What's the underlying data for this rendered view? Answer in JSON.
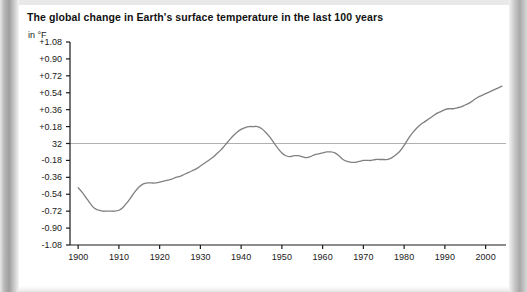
{
  "figure": {
    "title": "The global change in Earth's surface temperature in the last 100 years",
    "unit_label": "in °F"
  },
  "colors": {
    "line": "#808080",
    "zero_line": "#b0b0b0",
    "axis": "#1a1a1a",
    "text": "#1a1a1a",
    "page": "#ffffff"
  },
  "chart_data": {
    "type": "line",
    "title": "The global change in Earth's surface temperature in the last 100 years",
    "subtitle": "in °F",
    "xlabel": "",
    "ylabel": "in °F",
    "xlim": [
      1898,
      2005
    ],
    "ylim": [
      -1.08,
      1.08
    ],
    "grid": false,
    "legend": null,
    "zero_reference": {
      "value": 0,
      "label": "32"
    },
    "ytick_labels": [
      "+1.08",
      "+0.90",
      "+0.72",
      "+0.54",
      "+0.36",
      "+0.18",
      "32",
      "-0.18",
      "-0.36",
      "-0.54",
      "-0.72",
      "-0.90",
      "-1.08"
    ],
    "ytick_values": [
      1.08,
      0.9,
      0.72,
      0.54,
      0.36,
      0.18,
      0,
      -0.18,
      -0.36,
      -0.54,
      -0.72,
      -0.9,
      -1.08
    ],
    "xtick_labels": [
      "1900",
      "1910",
      "1920",
      "1930",
      "1940",
      "1950",
      "1960",
      "1970",
      "1980",
      "1990",
      "2000"
    ],
    "xtick_values": [
      1900,
      1910,
      1920,
      1930,
      1940,
      1950,
      1960,
      1970,
      1980,
      1990,
      2000
    ],
    "series": [
      {
        "name": "Global surface temperature anomaly",
        "x": [
          1900,
          1901,
          1902,
          1903,
          1904,
          1905,
          1906,
          1907,
          1908,
          1909,
          1910,
          1911,
          1912,
          1913,
          1914,
          1915,
          1916,
          1917,
          1918,
          1919,
          1920,
          1921,
          1922,
          1923,
          1924,
          1925,
          1926,
          1927,
          1928,
          1929,
          1930,
          1931,
          1932,
          1933,
          1934,
          1935,
          1936,
          1937,
          1938,
          1939,
          1940,
          1941,
          1942,
          1943,
          1944,
          1945,
          1946,
          1947,
          1948,
          1949,
          1950,
          1951,
          1952,
          1953,
          1954,
          1955,
          1956,
          1957,
          1958,
          1959,
          1960,
          1961,
          1962,
          1963,
          1964,
          1965,
          1966,
          1967,
          1968,
          1969,
          1970,
          1971,
          1972,
          1973,
          1974,
          1975,
          1976,
          1977,
          1978,
          1979,
          1980,
          1981,
          1982,
          1983,
          1984,
          1985,
          1986,
          1987,
          1988,
          1989,
          1990,
          1991,
          1992,
          1993,
          1994,
          1995,
          1996,
          1997,
          1998,
          1999,
          2000,
          2001,
          2002,
          2003,
          2004
        ],
        "y": [
          -0.47,
          -0.52,
          -0.58,
          -0.64,
          -0.69,
          -0.71,
          -0.72,
          -0.72,
          -0.72,
          -0.72,
          -0.71,
          -0.68,
          -0.63,
          -0.57,
          -0.51,
          -0.46,
          -0.43,
          -0.42,
          -0.42,
          -0.42,
          -0.41,
          -0.4,
          -0.39,
          -0.38,
          -0.36,
          -0.35,
          -0.33,
          -0.31,
          -0.29,
          -0.27,
          -0.24,
          -0.21,
          -0.18,
          -0.15,
          -0.11,
          -0.07,
          -0.02,
          0.03,
          0.08,
          0.12,
          0.15,
          0.17,
          0.18,
          0.18,
          0.18,
          0.16,
          0.12,
          0.07,
          0.01,
          -0.05,
          -0.1,
          -0.13,
          -0.14,
          -0.13,
          -0.13,
          -0.14,
          -0.15,
          -0.14,
          -0.12,
          -0.11,
          -0.1,
          -0.09,
          -0.09,
          -0.1,
          -0.13,
          -0.17,
          -0.19,
          -0.2,
          -0.2,
          -0.19,
          -0.18,
          -0.18,
          -0.18,
          -0.17,
          -0.17,
          -0.17,
          -0.17,
          -0.15,
          -0.12,
          -0.08,
          -0.02,
          0.05,
          0.11,
          0.16,
          0.2,
          0.23,
          0.26,
          0.29,
          0.32,
          0.34,
          0.36,
          0.37,
          0.37,
          0.38,
          0.39,
          0.41,
          0.43,
          0.46,
          0.49,
          0.51,
          0.53,
          0.55,
          0.57,
          0.59,
          0.61
        ]
      }
    ]
  }
}
